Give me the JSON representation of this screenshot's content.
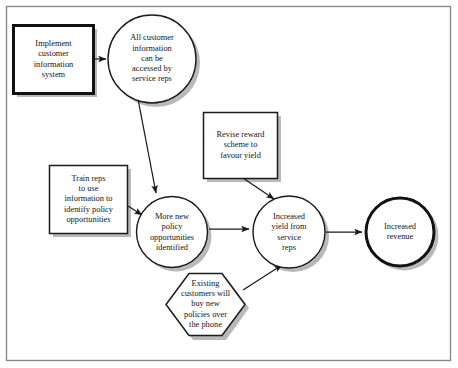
{
  "diagram": {
    "frame": {
      "border_color": "#8c8c8c",
      "background": "#ffffff"
    },
    "style": {
      "shape_fill": "#ffffff",
      "shape_stroke": "#1a1a1a",
      "shadow_color": "#b4b4b4",
      "text_color": "#141414",
      "arrow_color": "#1a1a1a"
    },
    "nodes": [
      {
        "id": "implement-customer-information-system",
        "shape": "rectangle-bold",
        "text": "Implement\ncustomer\ninformation\nsystem"
      },
      {
        "id": "all-customer-information-accessed",
        "shape": "circle",
        "text": "All customer\ninformation\ncan be\naccessed by\nservice reps"
      },
      {
        "id": "revise-reward-scheme",
        "shape": "rectangle",
        "text": "Revise reward\nscheme to\nfavour yield"
      },
      {
        "id": "train-reps",
        "shape": "rectangle",
        "text": "Train reps\nto use\ninformation to\nidentify policy\nopportunities"
      },
      {
        "id": "more-new-policy-opportunities",
        "shape": "circle",
        "text": "More new\npolicy\nopportunities\nidentified"
      },
      {
        "id": "increased-yield-from-service-reps",
        "shape": "circle",
        "text": "Increased\nyield from\nservice\nreps"
      },
      {
        "id": "existing-customers-buy-by-phone",
        "shape": "hexagon",
        "text": "Existing\ncustomers will\nbuy new\npolicies over\nthe phone"
      },
      {
        "id": "increased-revenue",
        "shape": "circle-bold",
        "text": "Increased\nrevenue"
      }
    ],
    "edges": [
      {
        "from": "implement-customer-information-system",
        "to": "all-customer-information-accessed"
      },
      {
        "from": "all-customer-information-accessed",
        "to": "more-new-policy-opportunities"
      },
      {
        "from": "train-reps",
        "to": "more-new-policy-opportunities"
      },
      {
        "from": "more-new-policy-opportunities",
        "to": "increased-yield-from-service-reps"
      },
      {
        "from": "revise-reward-scheme",
        "to": "increased-yield-from-service-reps"
      },
      {
        "from": "existing-customers-buy-by-phone",
        "to": "increased-yield-from-service-reps"
      },
      {
        "from": "increased-yield-from-service-reps",
        "to": "increased-revenue"
      }
    ]
  }
}
